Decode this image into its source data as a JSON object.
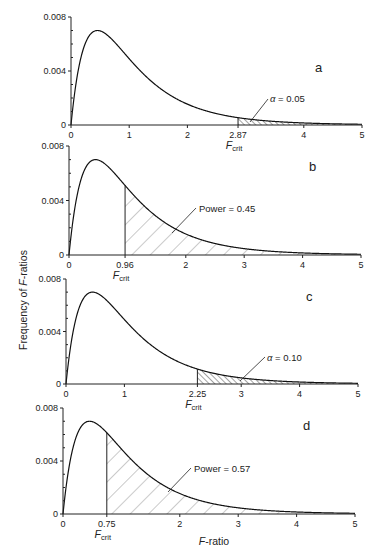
{
  "chart_data": [
    {
      "type": "area",
      "panel": "a",
      "title": "a",
      "xlabel": "",
      "ylabel": "Frequency of F-ratios",
      "xlim": [
        0,
        5
      ],
      "ylim": [
        0,
        0.008
      ],
      "x_ticks": [
        "0",
        "1",
        "2",
        "2.87",
        "4",
        "5"
      ],
      "y_ticks": [
        "0",
        "0.004",
        "0.008"
      ],
      "critical_value": 2.87,
      "critical_label": "F_crit",
      "shaded_region": "right tail beyond F_crit",
      "hatch": "dense",
      "annotation": "α = 0.05",
      "curve": "F distribution (null), peak ≈ 0.0070 at F ≈ 0.5"
    },
    {
      "type": "area",
      "panel": "b",
      "title": "b",
      "xlim": [
        0,
        5
      ],
      "ylim": [
        0,
        0.008
      ],
      "x_ticks": [
        "0",
        "0.96",
        "2",
        "3",
        "4",
        "5"
      ],
      "y_ticks": [
        "0",
        "0.004",
        "0.008"
      ],
      "critical_value": 0.96,
      "critical_label": "F_crit",
      "shaded_region": "right tail beyond F_crit",
      "hatch": "sparse",
      "annotation": "Power = 0.45",
      "curve": "F distribution, peak ≈ 0.0070 at F ≈ 0.5"
    },
    {
      "type": "area",
      "panel": "c",
      "title": "c",
      "xlim": [
        0,
        5
      ],
      "ylim": [
        0,
        0.008
      ],
      "x_ticks": [
        "0",
        "1",
        "2.25",
        "3",
        "4",
        "5"
      ],
      "y_ticks": [
        "0",
        "0.004",
        "0.008"
      ],
      "critical_value": 2.25,
      "critical_label": "F_crit",
      "shaded_region": "right tail beyond F_crit",
      "hatch": "dense",
      "annotation": "α = 0.10",
      "curve": "F distribution (null), peak ≈ 0.0070 at F ≈ 0.5"
    },
    {
      "type": "area",
      "panel": "d",
      "title": "d",
      "xlabel": "F-ratio",
      "xlim": [
        0,
        5
      ],
      "ylim": [
        0,
        0.008
      ],
      "x_ticks": [
        "0",
        "0.75",
        "2",
        "3",
        "4",
        "5"
      ],
      "y_ticks": [
        "0",
        "0.004",
        "0.008"
      ],
      "critical_value": 0.75,
      "critical_label": "F_crit",
      "shaded_region": "right tail beyond F_crit",
      "hatch": "sparse",
      "annotation": "Power = 0.57",
      "curve": "F distribution, peak ≈ 0.0070 at F ≈ 0.5"
    }
  ],
  "labels": {
    "ylabel": "Frequency of F-ratios",
    "xlabel_italic": "F",
    "xlabel_rest": "-ratio",
    "ylabel_pre": "Frequency of ",
    "ylabel_italic": "F",
    "ylabel_post": "-ratios",
    "fcrit_main": "F",
    "fcrit_sub": "crit"
  },
  "panels": [
    {
      "letter": "a",
      "y_ticks": [
        "0",
        "0.004",
        "0.008"
      ],
      "x_ticks": [
        "0",
        "1",
        "2",
        "2.87",
        "4",
        "5"
      ],
      "annot_symbol": "α",
      "annot_text": " = 0.05"
    },
    {
      "letter": "b",
      "y_ticks": [
        "0",
        "0.004",
        "0.008"
      ],
      "x_ticks": [
        "0",
        "0.96",
        "2",
        "3",
        "4",
        "5"
      ],
      "annot_text": "Power = 0.45"
    },
    {
      "letter": "c",
      "y_ticks": [
        "0",
        "0.004",
        "0.008"
      ],
      "x_ticks": [
        "0",
        "1",
        "2.25",
        "3",
        "4",
        "5"
      ],
      "annot_symbol": "α",
      "annot_text": " = 0.10"
    },
    {
      "letter": "d",
      "y_ticks": [
        "0",
        "0.004",
        "0.008"
      ],
      "x_ticks": [
        "0",
        "0.75",
        "2",
        "3",
        "4",
        "5"
      ],
      "annot_text": "Power = 0.57"
    }
  ]
}
